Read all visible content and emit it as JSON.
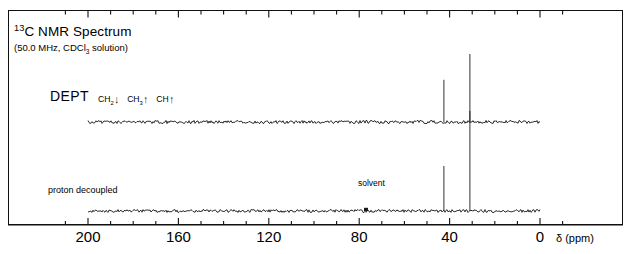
{
  "figure": {
    "title_pre": "13",
    "title_main": "C NMR Spectrum",
    "subtitle_pre": "(50.0 MHz, CDCl",
    "subtitle_sub": "3",
    "subtitle_post": " solution)",
    "dept_label": "DEPT",
    "dept_key": [
      {
        "species": "CH",
        "sub": "2",
        "arrow": "↓",
        "direction": "down"
      },
      {
        "species": "CH",
        "sub": "3",
        "arrow": "↑",
        "direction": "up"
      },
      {
        "species": "CH",
        "sub": "",
        "arrow": "↑",
        "direction": "up"
      }
    ],
    "proton_decoupled_label": "proton decoupled",
    "solvent_label": "solvent",
    "axis_unit": "δ (ppm)",
    "frame_color": "#111111",
    "trace_color": "#1a1a1a"
  },
  "chart_data": {
    "type": "line",
    "title": "13C NMR Spectrum",
    "subtitle": "(50.0 MHz, CDCl3 solution)",
    "xlabel": "δ (ppm)",
    "ylabel": "",
    "xlim": [
      210,
      -10
    ],
    "x_axis_reversed": true,
    "grid": false,
    "legend_position": "inside-top-left",
    "major_ticks": [
      200,
      160,
      120,
      80,
      40,
      0
    ],
    "major_tick_labels": [
      "200",
      "160",
      "120",
      "80",
      "40",
      "0"
    ],
    "minor_ticks": [
      210,
      190,
      180,
      170,
      150,
      140,
      130,
      110,
      100,
      90,
      70,
      60,
      50,
      30,
      20,
      10,
      -10
    ],
    "tick_interval_ppm": 10,
    "series": [
      {
        "name": "DEPT",
        "baseline_ppm_range": [
          200,
          0
        ],
        "peaks": [
          {
            "ppm": 42.5,
            "intensity": 0.62,
            "assignment": "CH2",
            "phase": "up"
          },
          {
            "ppm": 31.0,
            "intensity": 1.0,
            "assignment": "CH3",
            "phase": "up"
          }
        ]
      },
      {
        "name": "proton decoupled",
        "baseline_ppm_range": [
          200,
          0
        ],
        "peaks": [
          {
            "ppm": 77.0,
            "intensity": 0.05,
            "assignment": "solvent (CDCl3)",
            "phase": "up"
          },
          {
            "ppm": 42.5,
            "intensity": 0.45,
            "assignment": "CH2",
            "phase": "up"
          },
          {
            "ppm": 31.0,
            "intensity": 1.0,
            "assignment": "CH3",
            "phase": "up"
          }
        ]
      }
    ],
    "annotations": [
      {
        "text": "DEPT",
        "ppm": 182,
        "note": "upper trace label"
      },
      {
        "text": "CH2↓ CH3↑ CH↑",
        "ppm": 165,
        "note": "DEPT phase key"
      },
      {
        "text": "proton decoupled",
        "ppm": 183,
        "note": "lower trace label"
      },
      {
        "text": "solvent",
        "ppm": 77,
        "note": "points to CDCl3 triplet centre"
      }
    ]
  }
}
